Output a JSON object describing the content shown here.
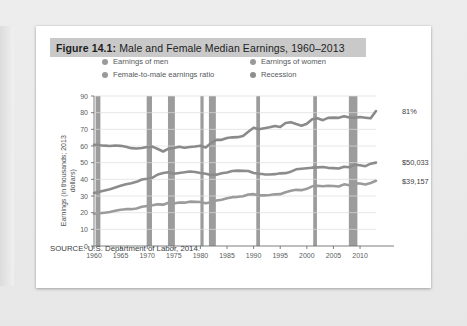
{
  "figure": {
    "label": "Figure 14.1:",
    "title": "Male and Female Median Earnings, 1960–2013",
    "source": "SOURCE: U.S. Department of Labor, 2014."
  },
  "legend": {
    "position": "top",
    "items": [
      {
        "label": "Earnings of men",
        "color": "#9a9a9a",
        "marker": "circle"
      },
      {
        "label": "Earnings of women",
        "color": "#9a9a9a",
        "marker": "circle"
      },
      {
        "label": "Female-to-male earnings ratio",
        "color": "#9a9a9a",
        "marker": "circle"
      },
      {
        "label": "Recession",
        "color": "#8e8e8e",
        "marker": "circle"
      }
    ]
  },
  "colors": {
    "line_men": "#8c8c8c",
    "line_women": "#9b9b9b",
    "line_ratio": "#8a8a8a",
    "recession_band": "#9c9c9c",
    "gridline": "#dcdcdc",
    "axis": "#6e7173",
    "title_highlight": "#c9c9c9"
  },
  "chart_data": {
    "type": "line",
    "title": "Male and Female Median Earnings, 1960–2013",
    "xlabel": "",
    "ylabel": "Earnings (in thousands; 2013 dollars)",
    "xlim": [
      1960,
      2013
    ],
    "ylim": [
      0,
      90
    ],
    "ytick_values": [
      0,
      10,
      20,
      30,
      40,
      50,
      60,
      70,
      80,
      90
    ],
    "xtick_values": [
      1960,
      1965,
      1970,
      1975,
      1980,
      1985,
      1990,
      1995,
      2000,
      2005,
      2010
    ],
    "grid": "horizontal",
    "end_labels": [
      {
        "series": "Female-to-male earnings ratio",
        "text": "81%",
        "value": 81
      },
      {
        "series": "Earnings of men",
        "text": "$50,033",
        "value": 50.033
      },
      {
        "series": "Earnings of women",
        "text": "$39,157",
        "value": 39.157
      }
    ],
    "x": [
      1960,
      1961,
      1962,
      1963,
      1964,
      1965,
      1966,
      1967,
      1968,
      1969,
      1970,
      1971,
      1972,
      1973,
      1974,
      1975,
      1976,
      1977,
      1978,
      1979,
      1980,
      1981,
      1982,
      1983,
      1984,
      1985,
      1986,
      1987,
      1988,
      1989,
      1990,
      1991,
      1992,
      1993,
      1994,
      1995,
      1996,
      1997,
      1998,
      1999,
      2000,
      2001,
      2002,
      2003,
      2004,
      2005,
      2006,
      2007,
      2008,
      2009,
      2010,
      2011,
      2012,
      2013
    ],
    "series": [
      {
        "name": "Female-to-male earnings ratio",
        "unit": "percent",
        "values": [
          60.7,
          60.5,
          60.2,
          60.0,
          60.3,
          60.1,
          59.5,
          58.7,
          58.5,
          58.8,
          59.4,
          59.6,
          58.2,
          56.7,
          58.4,
          58.8,
          59.6,
          58.9,
          59.4,
          59.7,
          60.2,
          59.1,
          61.8,
          63.7,
          63.7,
          64.8,
          65.2,
          65.3,
          66.0,
          68.6,
          71.0,
          70.0,
          70.7,
          71.3,
          72.0,
          71.4,
          73.8,
          74.3,
          73.2,
          72.2,
          73.4,
          76.1,
          76.6,
          75.5,
          76.9,
          77.0,
          76.9,
          77.8,
          77.1,
          77.0,
          77.4,
          77.0,
          76.6,
          81.0
        ]
      },
      {
        "name": "Earnings of men",
        "unit": "thousands_2013_dollars",
        "values": [
          31.8,
          32.5,
          33.3,
          34.0,
          35.1,
          36.1,
          37.1,
          37.7,
          38.5,
          39.9,
          40.4,
          41.0,
          42.9,
          43.8,
          44.3,
          43.4,
          43.8,
          44.2,
          44.7,
          44.4,
          43.8,
          43.3,
          42.6,
          42.8,
          43.6,
          44.1,
          45.0,
          45.2,
          45.1,
          45.0,
          43.8,
          43.4,
          43.0,
          42.9,
          43.1,
          43.6,
          43.7,
          44.6,
          46.0,
          46.4,
          46.7,
          47.0,
          47.2,
          47.4,
          46.9,
          46.7,
          46.5,
          47.6,
          47.2,
          48.8,
          48.4,
          47.9,
          49.4,
          50.033
        ]
      },
      {
        "name": "Earnings of women",
        "unit": "thousands_2013_dollars",
        "values": [
          19.3,
          19.6,
          20.0,
          20.4,
          21.1,
          21.7,
          22.1,
          22.1,
          22.5,
          23.5,
          24.0,
          24.4,
          25.0,
          24.8,
          25.9,
          25.5,
          26.1,
          26.0,
          26.6,
          26.5,
          26.4,
          25.6,
          26.3,
          27.3,
          27.8,
          28.6,
          29.3,
          29.5,
          29.8,
          30.9,
          31.1,
          30.4,
          30.4,
          30.6,
          31.0,
          31.1,
          32.3,
          33.1,
          33.7,
          33.5,
          34.3,
          35.8,
          36.2,
          35.8,
          36.1,
          36.0,
          35.7,
          37.0,
          36.4,
          37.6,
          37.5,
          36.9,
          37.8,
          39.157
        ]
      }
    ],
    "recessions": [
      {
        "start": 1960.3,
        "end": 1961.2
      },
      {
        "start": 1969.9,
        "end": 1970.9
      },
      {
        "start": 1973.9,
        "end": 1975.2
      },
      {
        "start": 1980.0,
        "end": 1980.6
      },
      {
        "start": 1981.6,
        "end": 1982.9
      },
      {
        "start": 1990.5,
        "end": 1991.2
      },
      {
        "start": 2001.2,
        "end": 2001.9
      },
      {
        "start": 2007.9,
        "end": 2009.5
      }
    ]
  }
}
